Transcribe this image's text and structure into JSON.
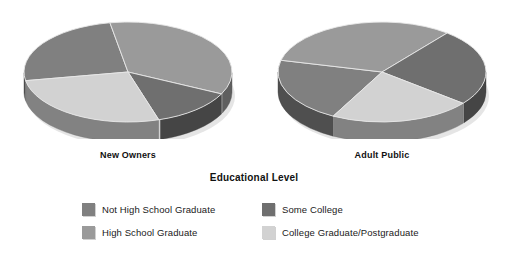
{
  "chart_data": {
    "type": "pie",
    "title": "Educational Level",
    "legend_position": "bottom",
    "categories": [
      "Not High School Graduate",
      "High School Graduate",
      "Some College",
      "College Graduate/Postgraduate"
    ],
    "colors": [
      "#808080",
      "#9a9a9a",
      "#6f6f6f",
      "#d2d2d2"
    ],
    "series": [
      {
        "name": "New Owners",
        "values": [
          25,
          35,
          13,
          27
        ]
      },
      {
        "name": "Adult Public",
        "values": [
          21,
          32,
          25,
          22
        ]
      }
    ]
  },
  "legend": {
    "items": [
      {
        "label": "Not High School Graduate",
        "color": "#808080"
      },
      {
        "label": "Some College",
        "color": "#6f6f6f"
      },
      {
        "label": "High School Graduate",
        "color": "#9a9a9a"
      },
      {
        "label": "College Graduate/Postgraduate",
        "color": "#d2d2d2"
      }
    ]
  },
  "panels": [
    {
      "caption": "New Owners"
    },
    {
      "caption": "Adult Public"
    }
  ]
}
